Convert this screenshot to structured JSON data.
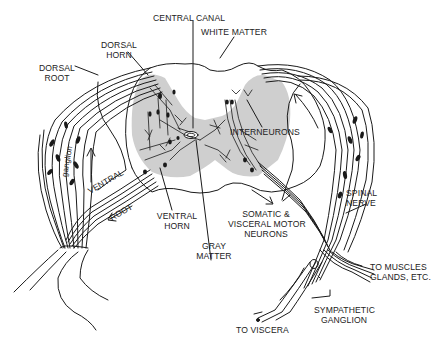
{
  "diagram": {
    "colors": {
      "background": "#ffffff",
      "gray_matter": "#cfcfcf",
      "line": "#1a1a1a",
      "text": "#222222"
    },
    "labels": {
      "central_canal": "CENTRAL CANAL",
      "white_matter": "WHITE MATTER",
      "dorsal_horn_1": "DORSAL",
      "dorsal_horn_2": "HORN",
      "dorsal_root_1": "DORSAL",
      "dorsal_root_2": "ROOT",
      "ganglion": "ganglion",
      "ventral": "VENTRAL",
      "root": "ROOT",
      "interneurons": "INTERNEURONS",
      "ventral_horn_1": "VENTRAL",
      "ventral_horn_2": "HORN",
      "gray_matter_1": "GRAY",
      "gray_matter_2": "MATTER",
      "somatic_1": "SOMATIC &",
      "somatic_2": "VISCERAL MOTOR",
      "somatic_3": "NEURONS",
      "spinal_nerve_1": "SPINAL",
      "spinal_nerve_2": "NERVE",
      "to_muscles_1": "TO MUSCLES",
      "to_muscles_2": "GLANDS, ETC.",
      "sympathetic_1": "SYMPATHETIC",
      "sympathetic_2": "GANGLION",
      "to_viscera": "TO VISCERA"
    }
  }
}
